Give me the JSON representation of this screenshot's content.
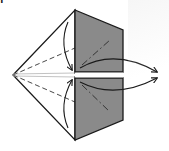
{
  "diagram": {
    "type": "origami-fold-diagram",
    "step_label_fragment": "f",
    "colors": {
      "background": "#ffffff",
      "paper_white_side": "#ffffff",
      "paper_colored_side": "#8a8a8a",
      "line": "#1a1a1a",
      "watermark": "#f0f0f0"
    },
    "shapes": {
      "kite_white_left": {
        "points": [
          [
            13,
            75
          ],
          [
            75,
            10
          ],
          [
            75,
            140
          ]
        ],
        "description": "white kite shape, left half"
      },
      "gray_panel_top": {
        "points": [
          [
            75,
            10
          ],
          [
            123,
            30
          ],
          [
            123,
            72
          ],
          [
            75,
            72
          ]
        ]
      },
      "gray_panel_bottom": {
        "points": [
          [
            75,
            78
          ],
          [
            123,
            78
          ],
          [
            123,
            120
          ],
          [
            75,
            140
          ]
        ]
      },
      "center_gap": {
        "y_top": 72,
        "y_bottom": 78
      }
    },
    "fold_lines": {
      "valley_dashed": [
        {
          "from": [
            13,
            75
          ],
          "to": [
            75,
            48
          ]
        },
        {
          "from": [
            13,
            75
          ],
          "to": [
            75,
            102
          ]
        },
        {
          "from": [
            13,
            75
          ],
          "to": [
            75,
            75
          ]
        }
      ],
      "mountain_dash_dot": [
        {
          "from": [
            82,
            65
          ],
          "to": [
            110,
            40
          ]
        },
        {
          "from": [
            82,
            85
          ],
          "to": [
            110,
            112
          ]
        }
      ]
    },
    "arrows": [
      {
        "name": "upper-flap-down-arrow",
        "path": "M68,22 Q58,45 72,70",
        "head": "down"
      },
      {
        "name": "lower-flap-up-arrow",
        "path": "M68,128 Q58,105 72,80",
        "head": "up"
      },
      {
        "name": "upper-pull-right-arrow",
        "path": "M80,68 Q115,48 157,72",
        "head": "right"
      },
      {
        "name": "lower-pull-right-arrow",
        "path": "M80,82 Q115,100 157,78",
        "head": "right"
      }
    ],
    "instruction_meaning": "Fold the flaps toward the center along the valley folds while pulling the inner gray layers out to the right"
  }
}
